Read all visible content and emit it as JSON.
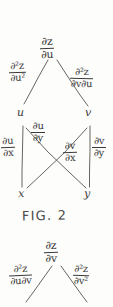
{
  "document": {
    "kind": "handwritten-notes",
    "ink_color": "#3a3a3a",
    "paper_color": "#fdfdfc"
  },
  "figure_1": {
    "caption": "FIG. 2",
    "root": {
      "numerator": "∂z",
      "denominator": "∂u"
    },
    "level1_edge_labels": {
      "left": {
        "numerator": "∂²z",
        "denominator": "∂u²"
      },
      "right": {
        "numerator": "∂²z",
        "denominator": "∂v∂u"
      }
    },
    "level1_nodes": {
      "left": "u",
      "right": "v"
    },
    "level2_edge_labels": {
      "u_to_x": {
        "numerator": "∂u",
        "denominator": "∂x"
      },
      "u_to_y": {
        "numerator": "∂u",
        "denominator": "∂y"
      },
      "v_to_x": {
        "numerator": "∂v",
        "denominator": "∂x"
      },
      "v_to_y": {
        "numerator": "∂v",
        "denominator": "∂y"
      }
    },
    "level2_nodes": {
      "left": "x",
      "right": "y"
    }
  },
  "figure_2": {
    "root": {
      "numerator": "∂z",
      "denominator": "∂v"
    },
    "level1_edge_labels": {
      "left": {
        "numerator": "∂²z",
        "denominator": "∂u∂v"
      },
      "right": {
        "numerator": "∂²z",
        "denominator": "∂v²"
      }
    }
  }
}
